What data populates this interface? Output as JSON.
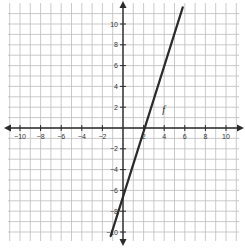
{
  "chart_data": {
    "type": "line",
    "title": "",
    "xlabel": "",
    "ylabel": "",
    "xlim": [
      -11,
      11
    ],
    "ylim": [
      -11,
      11
    ],
    "grid": true,
    "x_ticks": [
      -10,
      -8,
      -6,
      -4,
      -2,
      2,
      4,
      6,
      8,
      10
    ],
    "y_ticks": [
      -10,
      -8,
      -6,
      -4,
      -2,
      2,
      4,
      6,
      8,
      10
    ],
    "series": [
      {
        "name": "f",
        "equation": "y = 2x - 8",
        "slope": 2,
        "intercept": -8,
        "x": [
          -1.2,
          5.8
        ],
        "values": [
          -10.4,
          11.6
        ]
      }
    ],
    "annotations": [
      {
        "text": "f",
        "x": 4.4,
        "y": 1.6
      }
    ]
  },
  "colors": {
    "grid": "#bdbdbd",
    "axis": "#2b2b2b",
    "line": "#2a2a2a"
  }
}
